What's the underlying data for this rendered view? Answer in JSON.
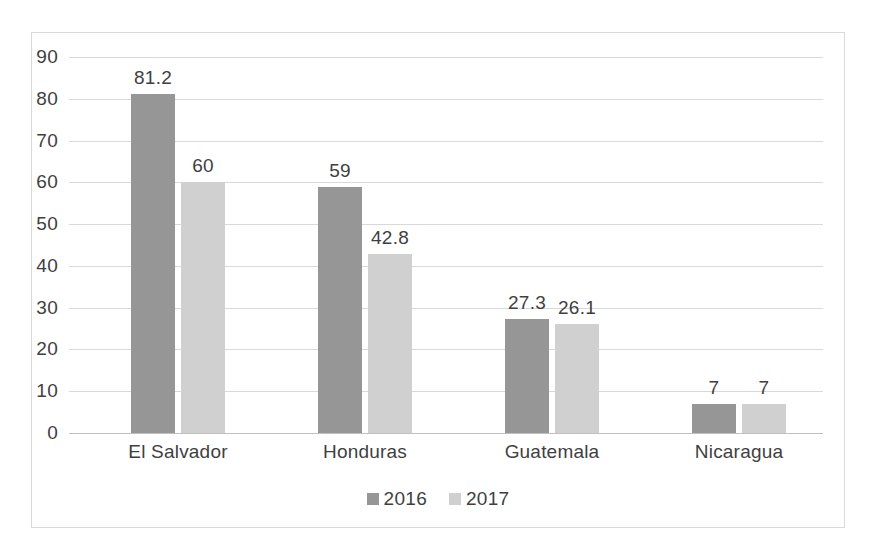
{
  "chart_data": {
    "type": "bar",
    "title": "",
    "subtitle": "",
    "xlabel": "",
    "ylabel": "",
    "categories": [
      "El Salvador",
      "Honduras",
      "Guatemala",
      "Nicaragua"
    ],
    "series": [
      {
        "name": "2016",
        "color": "#969696",
        "values": [
          81.2,
          59,
          27.3,
          7
        ],
        "labels": [
          "81.2",
          "59",
          "27.3",
          "7"
        ]
      },
      {
        "name": "2017",
        "color": "#d0d0d0",
        "values": [
          60,
          42.8,
          26.1,
          7
        ],
        "labels": [
          "60",
          "42.8",
          "26.1",
          "7"
        ]
      }
    ],
    "ylim": [
      0,
      90
    ],
    "ytick_step": 10,
    "yticks": [
      "90",
      "80",
      "70",
      "60",
      "50",
      "40",
      "30",
      "20",
      "10",
      "0"
    ],
    "grid": true,
    "legend_position": "bottom",
    "data_labels": true,
    "border_color": "#d9d9d9",
    "gridline_color": "#d9d9d9",
    "text_color": "#3f3f3f",
    "background": "#ffffff"
  }
}
